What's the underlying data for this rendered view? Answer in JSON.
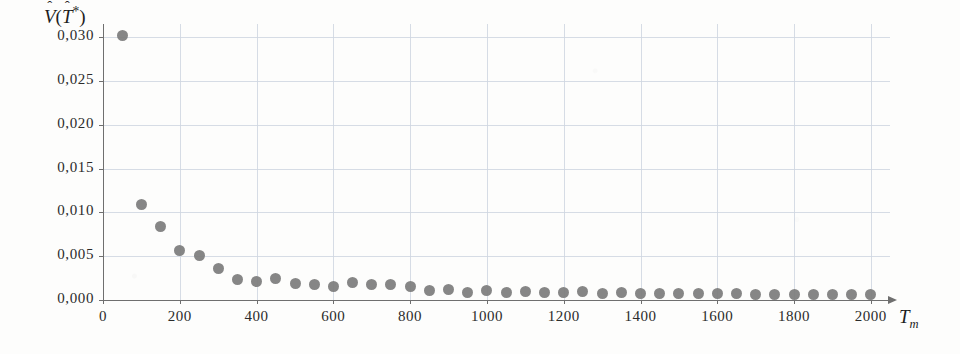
{
  "chart_data": {
    "type": "scatter",
    "title": "",
    "subtitle": "",
    "xlabel": "T_m",
    "ylabel": "V̂(T̂*)",
    "ylabel_parts": {
      "base_symbol": "V",
      "hat": "ˆ",
      "open_paren": "(",
      "arg_symbol": "T",
      "arg_star": "*",
      "close_paren": ")"
    },
    "xlabel_parts": {
      "base_symbol": "T",
      "subscript": "m"
    },
    "grid": true,
    "legend": null,
    "xlim": [
      0,
      2050
    ],
    "ylim": [
      0.0,
      0.0315
    ],
    "x_tick_labels": [
      "0",
      "200",
      "400",
      "600",
      "800",
      "1000",
      "1200",
      "1400",
      "1600",
      "1800",
      "2000"
    ],
    "x_ticks": [
      0,
      200,
      400,
      600,
      800,
      1000,
      1200,
      1400,
      1600,
      1800,
      2000
    ],
    "y_tick_labels": [
      "0,000",
      "0,005",
      "0,010",
      "0,015",
      "0,020",
      "0,025",
      "0,030"
    ],
    "y_ticks": [
      0.0,
      0.005,
      0.01,
      0.015,
      0.02,
      0.025,
      0.03
    ],
    "decimal_separator": ",",
    "marker": {
      "shape": "circle",
      "color": "#7c7c7c",
      "size_px": 11
    },
    "colors": {
      "marker": "#7c7c7c",
      "grid": "#cfd6e0",
      "axis": "#6f6f6f",
      "text": "#2b2b2b",
      "background": "#fdfdfc"
    },
    "x": [
      50,
      100,
      150,
      200,
      250,
      300,
      350,
      400,
      450,
      500,
      550,
      600,
      650,
      700,
      750,
      800,
      850,
      900,
      950,
      1000,
      1050,
      1100,
      1150,
      1200,
      1250,
      1300,
      1350,
      1400,
      1450,
      1500,
      1550,
      1600,
      1650,
      1700,
      1750,
      1800,
      1850,
      1900,
      1950,
      2000
    ],
    "values": [
      0.0302,
      0.0109,
      0.0084,
      0.0056,
      0.0051,
      0.0036,
      0.0024,
      0.0021,
      0.0025,
      0.0019,
      0.0018,
      0.0015,
      0.002,
      0.0018,
      0.0018,
      0.0015,
      0.0011,
      0.0012,
      0.0009,
      0.0011,
      0.0009,
      0.001,
      0.0009,
      0.0009,
      0.001,
      0.0008,
      0.0009,
      0.0008,
      0.0008,
      0.0008,
      0.0007,
      0.0007,
      0.0007,
      0.0006,
      0.0006,
      0.0006,
      0.0006,
      0.0006,
      0.0006,
      0.0006
    ]
  }
}
